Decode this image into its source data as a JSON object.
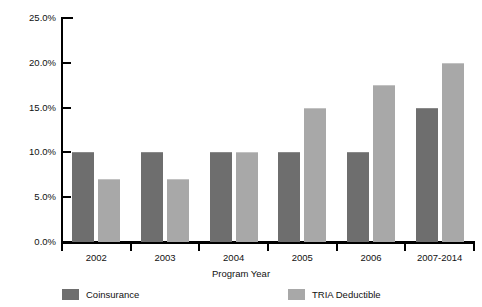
{
  "chart_data": {
    "type": "bar",
    "title": "",
    "subtitle": "",
    "xlabel": "Program Year",
    "ylabel": "",
    "categories": [
      "2002",
      "2003",
      "2004",
      "2005",
      "2006",
      "2007-2014"
    ],
    "series": [
      {
        "name": "Coinsurance",
        "color": "#6e6e6e",
        "values": [
          10.0,
          10.0,
          10.0,
          10.0,
          10.0,
          15.0
        ]
      },
      {
        "name": "TRIA Deductible",
        "color": "#a8a8a8",
        "values": [
          7.0,
          7.0,
          10.0,
          15.0,
          17.5,
          20.0
        ]
      }
    ],
    "ylim": [
      0,
      25
    ],
    "ytick_values": [
      0,
      5,
      10,
      15,
      20,
      25
    ],
    "ytick_labels": [
      "0.0%",
      "5.0%",
      "10.0%",
      "15.0%",
      "20.0%",
      "25.0%"
    ],
    "grid": false,
    "legend_position": "bottom",
    "value_suffix": "%"
  }
}
